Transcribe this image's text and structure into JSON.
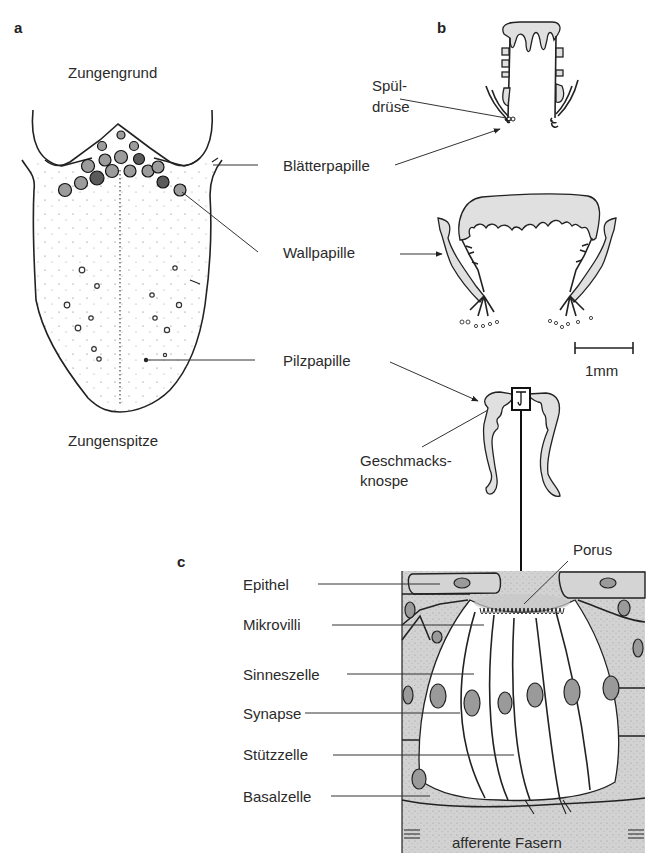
{
  "figure": {
    "panels": {
      "a": {
        "letter": "a",
        "title": "Tongue (dorsal view)",
        "labels": {
          "top": "Zungengrund",
          "bottom": "Zungenspitze"
        }
      },
      "b": {
        "letter": "b",
        "labels": {
          "spueldruese_line1": "Spül-",
          "spueldruese_line2": "drüse",
          "scale_bar": "1mm",
          "geschmacksknospe_line1": "Geschmacks-",
          "geschmacksknospe_line2": "knospe"
        }
      },
      "c": {
        "letter": "c",
        "labels": {
          "porus": "Porus",
          "epithel": "Epithel",
          "mikrovilli": "Mikrovilli",
          "sinneszelle": "Sinneszelle",
          "synapse": "Synapse",
          "stuetzzelle": "Stützzelle",
          "basalzelle": "Basalzelle",
          "afferente_fasern": "afferente Fasern"
        }
      }
    },
    "center_labels": {
      "blaetterpapille": "Blätterpapille",
      "wallpapille": "Wallpapille",
      "pilzpapille": "Pilzpapille"
    }
  }
}
